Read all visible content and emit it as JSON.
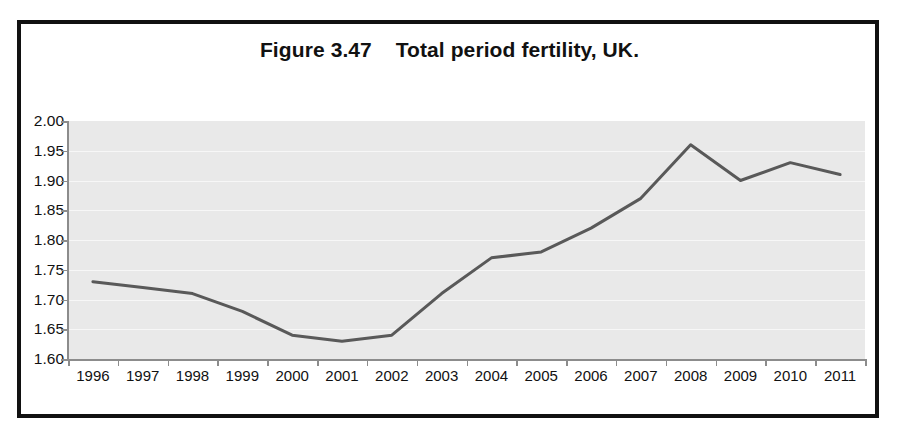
{
  "figure": {
    "title": "Figure 3.47    Total period fertility, UK.",
    "frame_color": "#111111",
    "plot_background": "#e9e9e9",
    "gridline_color": "#f7f7f7",
    "axis_color": "#8c8c8c",
    "series_color": "#595959"
  },
  "chart_data": {
    "type": "line",
    "title": "Figure 3.47    Total period fertility, UK.",
    "xlabel": "",
    "ylabel": "",
    "categories": [
      "1996",
      "1997",
      "1998",
      "1999",
      "2000",
      "2001",
      "2002",
      "2003",
      "2004",
      "2005",
      "2006",
      "2007",
      "2008",
      "2009",
      "2010",
      "2011"
    ],
    "values": [
      1.73,
      1.72,
      1.71,
      1.68,
      1.64,
      1.63,
      1.64,
      1.71,
      1.77,
      1.78,
      1.82,
      1.87,
      1.96,
      1.9,
      1.93,
      1.91
    ],
    "series": [
      {
        "name": "Total period fertility rate",
        "values": [
          1.73,
          1.72,
          1.71,
          1.68,
          1.64,
          1.63,
          1.64,
          1.71,
          1.77,
          1.78,
          1.82,
          1.87,
          1.96,
          1.9,
          1.93,
          1.91
        ]
      }
    ],
    "ylim": [
      1.6,
      2.0
    ],
    "ytick_values": [
      2.0,
      1.95,
      1.9,
      1.85,
      1.8,
      1.75,
      1.7,
      1.65,
      1.6
    ],
    "ytick_labels": [
      "2.00",
      "1.95",
      "1.90",
      "1.85",
      "1.80",
      "1.75",
      "1.70",
      "1.65",
      "1.60"
    ],
    "xtick_labels": [
      "1996",
      "1997",
      "1998",
      "1999",
      "2000",
      "2001",
      "2002",
      "2003",
      "2004",
      "2005",
      "2006",
      "2007",
      "2008",
      "2009",
      "2010",
      "2011"
    ],
    "grid": true,
    "grid_axis": "y",
    "legend": false,
    "legend_position": "none",
    "markers": false,
    "line_width": 3
  }
}
